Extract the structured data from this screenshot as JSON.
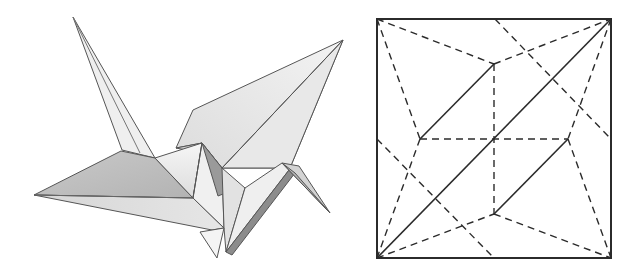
{
  "figure": {
    "panels": [
      {
        "id": "crane",
        "kind": "illustration",
        "subject": "origami-crane",
        "colors": {
          "edge": "#555555",
          "light_face": "#f2f2f2",
          "mid_face": "#d9d9d9",
          "dark_face": "#a8a8a8",
          "shadow_face": "#8c8c8c"
        }
      },
      {
        "id": "crease-pattern",
        "kind": "diagram",
        "subject": "crane-crease-pattern",
        "square": {
          "x": 377,
          "y": 19,
          "size": 234
        },
        "legend": {
          "solid": "mountain-or-edge",
          "dashed": "valley-fold"
        },
        "colors": {
          "line": "#2b2b2b"
        }
      }
    ]
  }
}
